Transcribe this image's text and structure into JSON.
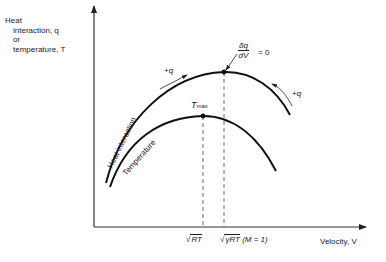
{
  "y_axis": {
    "label_line1": "Heat",
    "label_line2": "interaction, q",
    "label_line3": "or",
    "label_line4": "temperature, T"
  },
  "x_axis": {
    "label": "Velocity, V"
  },
  "curves": {
    "heat": {
      "label": "Heat interaction",
      "color": "#111111"
    },
    "temperature": {
      "label": "Temperature",
      "color": "#111111"
    }
  },
  "annotations": {
    "plus_q_left": "+q",
    "plus_q_right": "+q",
    "t_max_main": "T",
    "t_max_sub": "max",
    "deriv_num": "δq",
    "deriv_den": "dV",
    "deriv_eq": "= 0",
    "tick1_sqrt": "RT",
    "tick2_sqrt": "γRT",
    "tick2_suffix": "(M = 1)"
  }
}
